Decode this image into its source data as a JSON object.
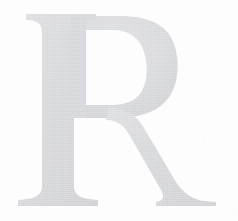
{
  "image": {
    "kind": "scanned-drop-cap",
    "description": "Large pale grey serif capital letter R on an off-white page, scanned from print",
    "letter": "R",
    "letter_case": "uppercase",
    "typeface_style": "transitional serif",
    "width_px": 238,
    "height_px": 221
  },
  "colors": {
    "background": "#fdfdfd",
    "paper_tone": "#f6f6f7",
    "ink_light": "#e2e3e5",
    "ink_mid": "#d7d8da",
    "ink_dark": "#cdced1",
    "ink_edge": "#c6c7ca"
  },
  "glyph_metrics": {
    "cap_top_y": 14,
    "baseline_y": 205,
    "stem_left_x": 42,
    "stem_right_x": 72,
    "top_serif_left_x": 26,
    "top_serif_right_x": 96,
    "foot_serif_left_x": 18,
    "foot_serif_right_x": 98,
    "bowl_right_x": 176,
    "bowl_waist_y": 112,
    "leg_terminal_x": 216,
    "counter_center_x": 112,
    "counter_center_y": 66
  },
  "labels": {
    "letter_readout": "R"
  }
}
